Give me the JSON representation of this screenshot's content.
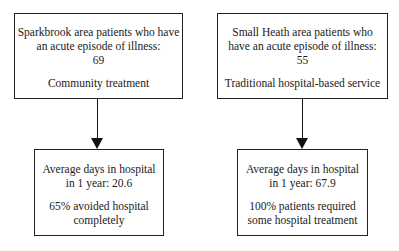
{
  "diagram": {
    "left": {
      "top_box": {
        "lines": [
          "Sparkbrook area patients who have",
          "an acute episode of illness:",
          "69"
        ],
        "treatment": "Community treatment"
      },
      "bottom_box": {
        "lines": [
          "Average days in hospital",
          "in 1 year: 20.6"
        ],
        "outcome_lines": [
          "65% avoided hospital",
          "completely"
        ]
      }
    },
    "right": {
      "top_box": {
        "lines": [
          "Small Heath area patients who",
          "have an acute episode of illness:",
          "55"
        ],
        "treatment": "Traditional hospital-based service"
      },
      "bottom_box": {
        "lines": [
          "Average days in hospital",
          "in 1 year: 67.9"
        ],
        "outcome_lines": [
          "100% patients required",
          "some hospital treatment"
        ]
      }
    }
  }
}
